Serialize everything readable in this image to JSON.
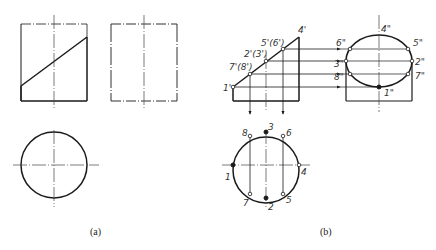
{
  "figure": {
    "panels": [
      {
        "id": "a",
        "caption": "(a)",
        "views": [
          "front view: rectangle with oblique cut line",
          "side view: rectangle",
          "top view: circle"
        ]
      },
      {
        "id": "b",
        "caption": "(b)",
        "front_labels": {
          "p1": "1'",
          "p78": "7'(8')",
          "p23": "2'(3')",
          "p56": "5'(6')",
          "p4": "4'"
        },
        "side_labels": {
          "p4": "4\"",
          "p6": "6\"",
          "p5": "5\"",
          "p3": "3\"",
          "p2": "2\"",
          "p8": "8\"",
          "p7": "7\"",
          "p1": "1\""
        },
        "top_labels": {
          "p1": "1",
          "p2": "2",
          "p3": "3",
          "p4": "4",
          "p5": "5",
          "p6": "6",
          "p7": "7",
          "p8": "8"
        }
      }
    ]
  },
  "colors": {
    "line": "#1a1a1a",
    "center_line": "#444444",
    "background": "#ffffff"
  }
}
